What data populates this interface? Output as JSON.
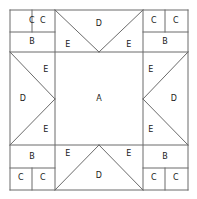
{
  "diagram": {
    "type": "quilt-block-layout",
    "stroke_color": "#6b6b6b",
    "fill_color": "#ffffff",
    "text_color": "#1a1a1a",
    "canvas": {
      "width": 197,
      "height": 199
    },
    "frame": {
      "x0": 10,
      "y0": 10,
      "x1": 188,
      "y1": 190
    },
    "grid": {
      "vertical_lines": [
        10,
        55,
        143,
        188
      ],
      "horizontal_lines": [
        10,
        52,
        145,
        190
      ],
      "corner_size": 45,
      "center_span": 88
    },
    "patch_labels": {
      "A": "A",
      "B": "B",
      "C": "C",
      "D": "D",
      "E": "E"
    },
    "patches": [
      {
        "id": "center-a",
        "label": "A",
        "x": 99,
        "y": 99
      },
      {
        "id": "tl-c-left",
        "label": "C",
        "x": 32,
        "y": 21
      },
      {
        "id": "tl-c-right",
        "label": "C",
        "x": 43,
        "y": 21
      },
      {
        "id": "tl-b",
        "label": "B",
        "x": 32,
        "y": 42
      },
      {
        "id": "tr-c-left",
        "label": "C",
        "x": 154,
        "y": 21
      },
      {
        "id": "tr-c-right",
        "label": "C",
        "x": 176,
        "y": 21
      },
      {
        "id": "tr-b",
        "label": "B",
        "x": 165,
        "y": 42
      },
      {
        "id": "bl-b",
        "label": "B",
        "x": 32,
        "y": 157
      },
      {
        "id": "bl-c-left",
        "label": "C",
        "x": 21,
        "y": 178
      },
      {
        "id": "bl-c-right",
        "label": "C",
        "x": 43,
        "y": 178
      },
      {
        "id": "br-b",
        "label": "B",
        "x": 165,
        "y": 157
      },
      {
        "id": "br-c-left",
        "label": "C",
        "x": 154,
        "y": 178
      },
      {
        "id": "br-c-right",
        "label": "C",
        "x": 176,
        "y": 178
      },
      {
        "id": "top-d",
        "label": "D",
        "x": 99,
        "y": 24
      },
      {
        "id": "top-e-left",
        "label": "E",
        "x": 68,
        "y": 45
      },
      {
        "id": "top-e-right",
        "label": "E",
        "x": 129,
        "y": 45
      },
      {
        "id": "bottom-d",
        "label": "D",
        "x": 99,
        "y": 176
      },
      {
        "id": "bottom-e-left",
        "label": "E",
        "x": 68,
        "y": 154
      },
      {
        "id": "bottom-e-right",
        "label": "E",
        "x": 129,
        "y": 154
      },
      {
        "id": "left-d",
        "label": "D",
        "x": 23,
        "y": 99
      },
      {
        "id": "left-e-top",
        "label": "E",
        "x": 46,
        "y": 70
      },
      {
        "id": "left-e-bottom",
        "label": "E",
        "x": 46,
        "y": 130
      },
      {
        "id": "right-d",
        "label": "D",
        "x": 174,
        "y": 99
      },
      {
        "id": "right-e-top",
        "label": "E",
        "x": 151,
        "y": 70
      },
      {
        "id": "right-e-bottom",
        "label": "E",
        "x": 151,
        "y": 130
      }
    ],
    "segments": [
      {
        "id": "frame-top",
        "x1": 10,
        "y1": 10,
        "x2": 188,
        "y2": 10
      },
      {
        "id": "frame-bottom",
        "x1": 10,
        "y1": 190,
        "x2": 188,
        "y2": 190
      },
      {
        "id": "frame-left",
        "x1": 10,
        "y1": 10,
        "x2": 10,
        "y2": 190
      },
      {
        "id": "frame-right",
        "x1": 188,
        "y1": 10,
        "x2": 188,
        "y2": 190
      },
      {
        "id": "grid-v-left",
        "x1": 55,
        "y1": 10,
        "x2": 55,
        "y2": 190
      },
      {
        "id": "grid-v-right",
        "x1": 143,
        "y1": 10,
        "x2": 143,
        "y2": 190
      },
      {
        "id": "grid-h-top",
        "x1": 10,
        "y1": 52,
        "x2": 188,
        "y2": 52
      },
      {
        "id": "grid-h-bottom",
        "x1": 10,
        "y1": 145,
        "x2": 188,
        "y2": 145
      },
      {
        "id": "tl-c-split",
        "x1": 32,
        "y1": 10,
        "x2": 32,
        "y2": 32
      },
      {
        "id": "tl-cb-split",
        "x1": 10,
        "y1": 32,
        "x2": 55,
        "y2": 32
      },
      {
        "id": "tr-c-split",
        "x1": 165,
        "y1": 10,
        "x2": 165,
        "y2": 32
      },
      {
        "id": "tr-cb-split",
        "x1": 143,
        "y1": 32,
        "x2": 188,
        "y2": 32
      },
      {
        "id": "bl-c-split",
        "x1": 32,
        "y1": 168,
        "x2": 32,
        "y2": 190
      },
      {
        "id": "bl-cb-split",
        "x1": 10,
        "y1": 168,
        "x2": 55,
        "y2": 168
      },
      {
        "id": "br-c-split",
        "x1": 165,
        "y1": 168,
        "x2": 165,
        "y2": 190
      },
      {
        "id": "br-cb-split",
        "x1": 143,
        "y1": 168,
        "x2": 188,
        "y2": 168
      },
      {
        "id": "top-diag-left",
        "x1": 55,
        "y1": 10,
        "x2": 99,
        "y2": 52
      },
      {
        "id": "top-diag-right",
        "x1": 143,
        "y1": 10,
        "x2": 99,
        "y2": 52
      },
      {
        "id": "bottom-diag-left",
        "x1": 55,
        "y1": 190,
        "x2": 99,
        "y2": 145
      },
      {
        "id": "bottom-diag-right",
        "x1": 143,
        "y1": 190,
        "x2": 99,
        "y2": 145
      },
      {
        "id": "left-diag-top",
        "x1": 10,
        "y1": 52,
        "x2": 55,
        "y2": 99
      },
      {
        "id": "left-diag-bottom",
        "x1": 10,
        "y1": 145,
        "x2": 55,
        "y2": 99
      },
      {
        "id": "right-diag-top",
        "x1": 188,
        "y1": 52,
        "x2": 143,
        "y2": 99
      },
      {
        "id": "right-diag-bottom",
        "x1": 188,
        "y1": 145,
        "x2": 143,
        "y2": 99
      }
    ]
  }
}
